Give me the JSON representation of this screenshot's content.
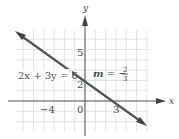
{
  "chart_data": {
    "type": "line",
    "title": "",
    "xlabel": "x",
    "ylabel": "y",
    "equation": "2x + 3y = 6",
    "slope_label": "m = −",
    "slope_num": "2",
    "slope_den": "3",
    "xlim": [
      -7,
      6
    ],
    "ylim": [
      -3,
      7
    ],
    "grid": true,
    "x_ticks": [
      {
        "value": -4,
        "label": "−4"
      },
      {
        "value": 0,
        "label": "0"
      },
      {
        "value": 3,
        "label": "3"
      }
    ],
    "y_ticks": [
      {
        "value": 2,
        "label": "2"
      },
      {
        "value": 5,
        "label": "5"
      }
    ],
    "series": [
      {
        "name": "2x + 3y = 6",
        "x": [
          -6.7,
          5.8
        ],
        "y": [
          6.47,
          -1.87
        ],
        "slope": -0.6667,
        "intercept": 2
      }
    ],
    "points": {
      "y_intercept": [
        0,
        2
      ],
      "x_intercept": [
        3,
        0
      ]
    },
    "colors": {
      "line": "#555555",
      "grid": "#d8d8d8",
      "axis": "#555555",
      "text": "#4a4a4a"
    }
  }
}
